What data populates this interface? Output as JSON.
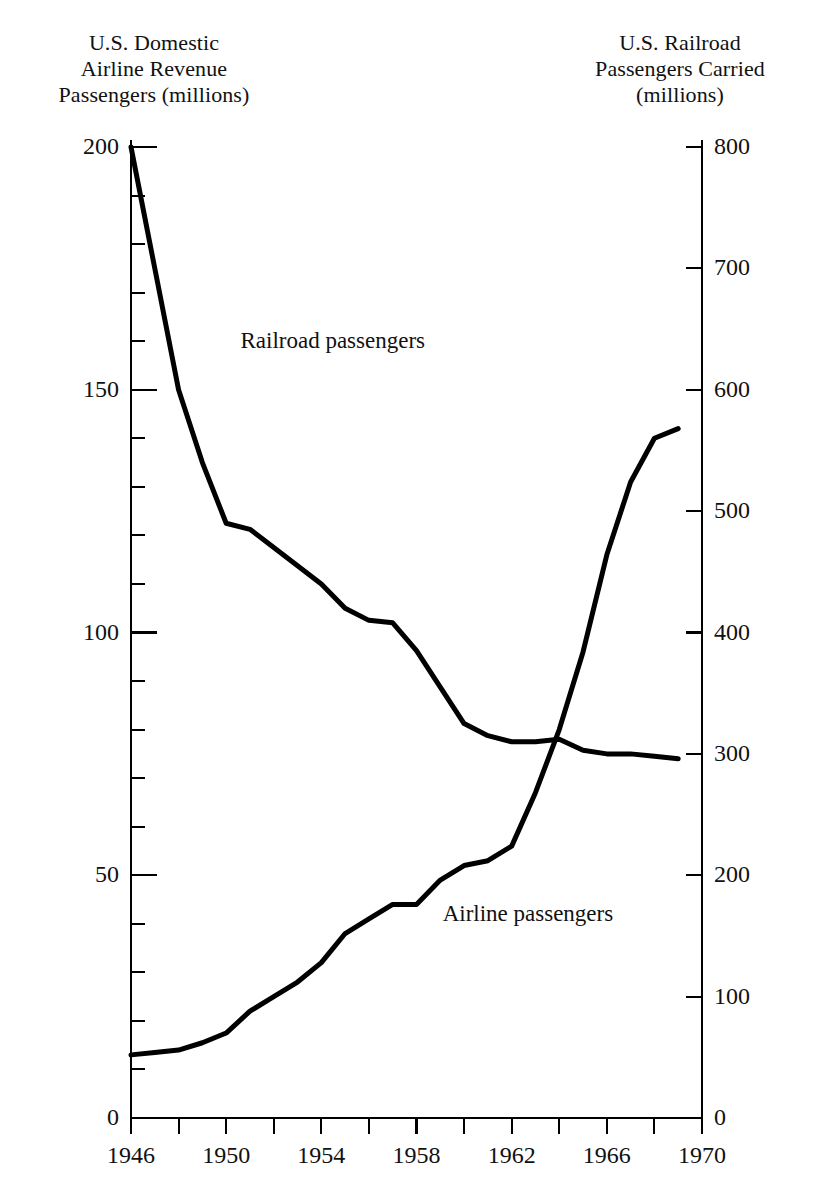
{
  "chart_data": {
    "type": "line",
    "title": "",
    "subtitle": "",
    "xlabel": "",
    "ylabel": "U.S. Domestic Airline Revenue Passengers (millions)",
    "y2label": "U.S. Railroad Passengers Carried (millions)",
    "grid": false,
    "legend_position": "inline-annotations",
    "xlim": [
      1946,
      1970
    ],
    "ylim": [
      0,
      200
    ],
    "y2lim": [
      0,
      800
    ],
    "x_major_ticks": [
      1946,
      1950,
      1954,
      1958,
      1962,
      1966,
      1970
    ],
    "x_minor_ticks": [
      1948,
      1952,
      1956,
      1960,
      1964,
      1968
    ],
    "x_tick_labels": [
      "1946",
      "1950",
      "1954",
      "1958",
      "1962",
      "1966",
      "1970"
    ],
    "y_major_ticks": [
      0,
      50,
      100,
      150,
      200
    ],
    "y_tick_labels": [
      "0",
      "50",
      "100",
      "150",
      "200"
    ],
    "y_minor_ticks": [
      10,
      20,
      30,
      40,
      60,
      70,
      80,
      90,
      110,
      120,
      130,
      140,
      160,
      170,
      180,
      190
    ],
    "y2_major_ticks": [
      0,
      100,
      200,
      300,
      400,
      500,
      600,
      700,
      800
    ],
    "y2_tick_labels": [
      "0",
      "100",
      "200",
      "300",
      "400",
      "500",
      "600",
      "700",
      "800"
    ],
    "x": [
      1946,
      1947,
      1948,
      1949,
      1950,
      1951,
      1952,
      1953,
      1954,
      1955,
      1956,
      1957,
      1958,
      1959,
      1960,
      1961,
      1962,
      1963,
      1964,
      1965,
      1966,
      1967,
      1968,
      1969
    ],
    "series": [
      {
        "name": "Railroad passengers",
        "axis": "right",
        "label": "Railroad passengers",
        "units": "millions",
        "values": [
          800,
          700,
          600,
          540,
          490,
          485,
          470,
          455,
          440,
          420,
          410,
          408,
          385,
          355,
          325,
          315,
          310,
          310,
          312,
          303,
          300,
          300,
          298,
          296
        ]
      },
      {
        "name": "Airline passengers",
        "axis": "left",
        "label": "Airline passengers",
        "units": "millions",
        "values": [
          13,
          13.5,
          14,
          15.5,
          17.5,
          22,
          25,
          28,
          32,
          38,
          41,
          44,
          44,
          49,
          52,
          53,
          56,
          67,
          80,
          96,
          116,
          131,
          140,
          142
        ]
      }
    ],
    "annotations": [
      {
        "text": "Railroad passengers",
        "x": 1950.6,
        "y2": 640
      },
      {
        "text": "Airline passengers",
        "x": 1959.1,
        "y": 42
      }
    ],
    "colors": {
      "line": "#000000",
      "axis": "#000000",
      "background": "#ffffff",
      "text": "#111111"
    }
  },
  "left_axis": {
    "title": "U.S. Domestic\nAirline Revenue\nPassengers (millions)"
  },
  "right_axis": {
    "title": "U.S. Railroad\nPassengers Carried\n(millions)"
  }
}
